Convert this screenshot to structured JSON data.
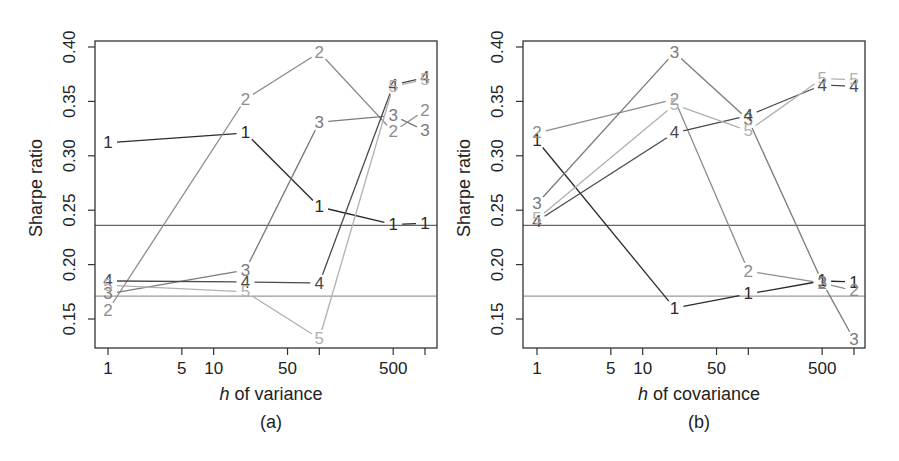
{
  "chart_data": [
    {
      "type": "line",
      "panel_label": "(a)",
      "xlabel_italic": "h",
      "xlabel_rest": " of variance",
      "ylabel": "Sharpe ratio",
      "x_scale": "log",
      "x_ticks": [
        1,
        5,
        10,
        50,
        100,
        500,
        1000
      ],
      "x_tick_labels": [
        "1",
        "5",
        "10",
        "50",
        "",
        "500",
        ""
      ],
      "y_ticks": [
        0.15,
        0.2,
        0.25,
        0.3,
        0.35,
        0.4
      ],
      "y_tick_labels": [
        "0.15",
        "0.20",
        "0.25",
        "0.30",
        "0.35",
        "0.40"
      ],
      "ylim": [
        0.125,
        0.405
      ],
      "x": [
        1,
        20,
        100,
        500,
        1000
      ],
      "reference_lines": [
        0.236,
        0.171
      ],
      "series": [
        {
          "name": "1",
          "color": "#2a2a2a",
          "values": [
            0.312,
            0.321,
            0.253,
            0.237,
            0.238
          ]
        },
        {
          "name": "2",
          "color": "#8c8c8c",
          "values": [
            0.158,
            0.352,
            0.395,
            0.322,
            0.342
          ]
        },
        {
          "name": "3",
          "color": "#7a7a7a",
          "values": [
            0.173,
            0.195,
            0.331,
            0.337,
            0.323
          ]
        },
        {
          "name": "4",
          "color": "#4a4a4a",
          "values": [
            0.185,
            0.184,
            0.183,
            0.365,
            0.372
          ]
        },
        {
          "name": "5",
          "color": "#b0b0b0",
          "values": [
            0.181,
            0.175,
            0.132,
            0.364,
            0.37
          ]
        }
      ]
    },
    {
      "type": "line",
      "panel_label": "(b)",
      "xlabel_italic": "h",
      "xlabel_rest": " of covariance",
      "ylabel": "Sharpe ratio",
      "x_scale": "log",
      "x_ticks": [
        1,
        5,
        10,
        50,
        100,
        500,
        1000
      ],
      "x_tick_labels": [
        "1",
        "5",
        "10",
        "50",
        "",
        "500",
        ""
      ],
      "y_ticks": [
        0.15,
        0.2,
        0.25,
        0.3,
        0.35,
        0.4
      ],
      "y_tick_labels": [
        "0.15",
        "0.20",
        "0.25",
        "0.30",
        "0.35",
        "0.40"
      ],
      "ylim": [
        0.125,
        0.405
      ],
      "x": [
        1,
        20,
        100,
        500,
        1000
      ],
      "reference_lines": [
        0.236,
        0.171
      ],
      "series": [
        {
          "name": "1",
          "color": "#2a2a2a",
          "values": [
            0.314,
            0.16,
            0.173,
            0.185,
            0.184
          ]
        },
        {
          "name": "2",
          "color": "#8c8c8c",
          "values": [
            0.321,
            0.352,
            0.194,
            0.183,
            0.176
          ]
        },
        {
          "name": "3",
          "color": "#7a7a7a",
          "values": [
            0.256,
            0.395,
            0.333,
            0.184,
            0.131
          ]
        },
        {
          "name": "4",
          "color": "#4a4a4a",
          "values": [
            0.24,
            0.321,
            0.337,
            0.365,
            0.364
          ]
        },
        {
          "name": "5",
          "color": "#b0b0b0",
          "values": [
            0.242,
            0.347,
            0.323,
            0.371,
            0.37
          ]
        }
      ]
    }
  ]
}
